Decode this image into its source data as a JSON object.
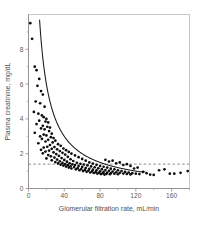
{
  "chart_data": {
    "type": "scatter",
    "title": "",
    "xlabel": "Glomerular filtration rate, mL/min",
    "ylabel": "Plasma creatinine, mg/dL",
    "xlim": [
      0,
      180
    ],
    "ylim": [
      0,
      10
    ],
    "xticks": [
      0,
      40,
      80,
      120,
      160
    ],
    "yticks": [
      0,
      2,
      4,
      6,
      8
    ],
    "xtick_labels": [
      "0",
      "40",
      "80",
      "120",
      "160"
    ],
    "ytick_labels": [
      "0",
      "2",
      "4",
      "6",
      "8"
    ],
    "x_minor_ticks": [
      20,
      60,
      100,
      140,
      180
    ],
    "y_minor_ticks": [
      1,
      3,
      5,
      7,
      9
    ],
    "grid": false,
    "legend": "none",
    "frame": "box",
    "annotations": [
      {
        "name": "upper-limit-normal-creatinine",
        "type": "horizontal-dashed-line",
        "y": 1.4,
        "label": ""
      },
      {
        "name": "inverse-relationship-fit-curve",
        "type": "curve",
        "equation": "plasma_creatinine = 120 / gfr",
        "x_range": [
          10,
          125
        ]
      }
    ],
    "series": [
      {
        "name": "patients",
        "marker": "filled-circle",
        "color": "#0c0c0c",
        "points": [
          [
            2,
            9.5
          ],
          [
            4,
            8.6
          ],
          [
            7,
            7.0
          ],
          [
            9,
            6.8
          ],
          [
            12,
            6.3
          ],
          [
            10,
            5.9
          ],
          [
            14,
            5.6
          ],
          [
            16,
            5.4
          ],
          [
            8,
            5.0
          ],
          [
            13,
            4.9
          ],
          [
            18,
            4.7
          ],
          [
            6,
            4.4
          ],
          [
            11,
            4.3
          ],
          [
            15,
            4.2
          ],
          [
            17,
            4.1
          ],
          [
            20,
            4.0
          ],
          [
            12,
            3.9
          ],
          [
            19,
            3.85
          ],
          [
            22,
            3.8
          ],
          [
            9,
            3.7
          ],
          [
            16,
            3.6
          ],
          [
            21,
            3.55
          ],
          [
            24,
            3.5
          ],
          [
            14,
            3.45
          ],
          [
            18,
            3.4
          ],
          [
            23,
            3.3
          ],
          [
            7,
            3.2
          ],
          [
            26,
            3.15
          ],
          [
            17,
            3.1
          ],
          [
            20,
            3.05
          ],
          [
            13,
            3.0
          ],
          [
            25,
            2.95
          ],
          [
            28,
            2.9
          ],
          [
            15,
            2.85
          ],
          [
            22,
            2.8
          ],
          [
            30,
            2.75
          ],
          [
            19,
            2.7
          ],
          [
            27,
            2.65
          ],
          [
            11,
            2.6
          ],
          [
            33,
            2.55
          ],
          [
            24,
            2.5
          ],
          [
            36,
            2.45
          ],
          [
            21,
            2.4
          ],
          [
            29,
            2.38
          ],
          [
            17,
            2.35
          ],
          [
            39,
            2.3
          ],
          [
            26,
            2.28
          ],
          [
            32,
            2.25
          ],
          [
            14,
            2.22
          ],
          [
            42,
            2.2
          ],
          [
            23,
            2.18
          ],
          [
            35,
            2.15
          ],
          [
            19,
            2.12
          ],
          [
            45,
            2.1
          ],
          [
            28,
            2.08
          ],
          [
            38,
            2.05
          ],
          [
            16,
            2.02
          ],
          [
            48,
            2.0
          ],
          [
            31,
            1.98
          ],
          [
            41,
            1.95
          ],
          [
            22,
            1.92
          ],
          [
            52,
            1.9
          ],
          [
            34,
            1.88
          ],
          [
            25,
            1.85
          ],
          [
            44,
            1.82
          ],
          [
            56,
            1.8
          ],
          [
            29,
            1.78
          ],
          [
            37,
            1.75
          ],
          [
            20,
            1.73
          ],
          [
            60,
            1.7
          ],
          [
            47,
            1.68
          ],
          [
            32,
            1.66
          ],
          [
            40,
            1.64
          ],
          [
            26,
            1.62
          ],
          [
            64,
            1.6
          ],
          [
            50,
            1.58
          ],
          [
            35,
            1.56
          ],
          [
            43,
            1.54
          ],
          [
            30,
            1.52
          ],
          [
            68,
            1.5
          ],
          [
            54,
            1.48
          ],
          [
            38,
            1.47
          ],
          [
            46,
            1.45
          ],
          [
            33,
            1.44
          ],
          [
            72,
            1.43
          ],
          [
            58,
            1.42
          ],
          [
            41,
            1.4
          ],
          [
            49,
            1.39
          ],
          [
            62,
            1.38
          ],
          [
            36,
            1.37
          ],
          [
            76,
            1.36
          ],
          [
            52,
            1.35
          ],
          [
            44,
            1.34
          ],
          [
            66,
            1.33
          ],
          [
            39,
            1.32
          ],
          [
            80,
            1.3
          ],
          [
            56,
            1.29
          ],
          [
            47,
            1.28
          ],
          [
            70,
            1.27
          ],
          [
            42,
            1.26
          ],
          [
            84,
            1.25
          ],
          [
            60,
            1.24
          ],
          [
            51,
            1.23
          ],
          [
            74,
            1.22
          ],
          [
            45,
            1.2
          ],
          [
            88,
            1.2
          ],
          [
            64,
            1.18
          ],
          [
            55,
            1.17
          ],
          [
            78,
            1.16
          ],
          [
            48,
            1.15
          ],
          [
            92,
            1.14
          ],
          [
            68,
            1.13
          ],
          [
            59,
            1.12
          ],
          [
            82,
            1.11
          ],
          [
            53,
            1.1
          ],
          [
            96,
            1.1
          ],
          [
            72,
            1.08
          ],
          [
            63,
            1.07
          ],
          [
            86,
            1.06
          ],
          [
            57,
            1.05
          ],
          [
            100,
            1.05
          ],
          [
            76,
            1.04
          ],
          [
            67,
            1.03
          ],
          [
            90,
            1.02
          ],
          [
            61,
            1.0
          ],
          [
            104,
            1.0
          ],
          [
            80,
            0.99
          ],
          [
            71,
            0.98
          ],
          [
            94,
            0.97
          ],
          [
            65,
            0.96
          ],
          [
            108,
            0.96
          ],
          [
            84,
            0.95
          ],
          [
            75,
            0.94
          ],
          [
            98,
            0.93
          ],
          [
            69,
            0.92
          ],
          [
            112,
            0.92
          ],
          [
            88,
            0.91
          ],
          [
            79,
            0.9
          ],
          [
            102,
            0.9
          ],
          [
            73,
            0.89
          ],
          [
            116,
            0.88
          ],
          [
            92,
            0.88
          ],
          [
            83,
            0.87
          ],
          [
            106,
            0.86
          ],
          [
            77,
            0.86
          ],
          [
            120,
            0.85
          ],
          [
            96,
            0.85
          ],
          [
            87,
            0.84
          ],
          [
            110,
            0.84
          ],
          [
            81,
            0.83
          ],
          [
            124,
            0.83
          ],
          [
            100,
            0.82
          ],
          [
            91,
            0.82
          ],
          [
            114,
            0.81
          ],
          [
            85,
            0.8
          ],
          [
            128,
            0.95
          ],
          [
            132,
            0.88
          ],
          [
            136,
            0.8
          ],
          [
            140,
            0.78
          ],
          [
            146,
            1.05
          ],
          [
            152,
            1.1
          ],
          [
            158,
            0.85
          ],
          [
            163,
            0.85
          ],
          [
            170,
            0.9
          ],
          [
            178,
            1.0
          ],
          [
            118,
            1.15
          ],
          [
            122,
            1.2
          ],
          [
            106,
            1.35
          ],
          [
            98,
            1.45
          ],
          [
            90,
            1.55
          ],
          [
            94,
            1.6
          ],
          [
            86,
            1.65
          ],
          [
            102,
            1.5
          ],
          [
            110,
            1.4
          ],
          [
            114,
            1.3
          ]
        ]
      }
    ]
  }
}
